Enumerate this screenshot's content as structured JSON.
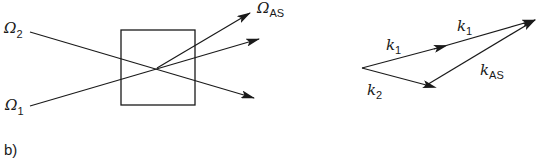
{
  "diagram": {
    "panel_label": "b)",
    "left": {
      "beams": [
        {
          "name": "Omega_2",
          "symbol": "Ω",
          "subscript": "2"
        },
        {
          "name": "Omega_1",
          "symbol": "Ω",
          "subscript": "1"
        },
        {
          "name": "Omega_AS",
          "symbol": "Ω",
          "subscript": "AS"
        }
      ],
      "sample": "box"
    },
    "right": {
      "vectors": [
        {
          "name": "k1_first",
          "symbol": "k",
          "subscript": "1"
        },
        {
          "name": "k1_second",
          "symbol": "k",
          "subscript": "1"
        },
        {
          "name": "k2",
          "symbol": "k",
          "subscript": "2"
        },
        {
          "name": "kAS",
          "symbol": "k",
          "subscript": "AS"
        }
      ]
    },
    "colors": {
      "ink": "#1a1a1a",
      "background": "#ffffff"
    }
  }
}
